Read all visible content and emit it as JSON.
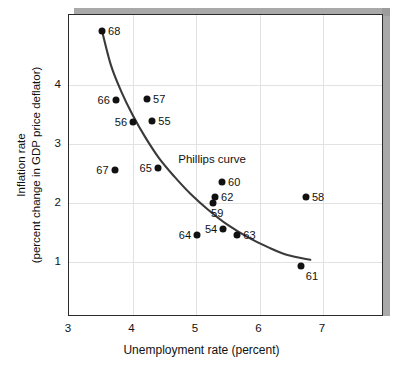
{
  "chart_data": {
    "type": "scatter",
    "title": "",
    "xlabel": "Unemployment rate (percent)",
    "ylabel_line1": "Inflation rate",
    "ylabel_line2": "(percent change in GDP  price  deflator)",
    "xlim": [
      3,
      7.96
    ],
    "ylim": [
      0.07,
      5.19
    ],
    "xticks": [
      3,
      4,
      5,
      6,
      7
    ],
    "xtick_labels": [
      "3",
      "4",
      "5",
      "6",
      "7"
    ],
    "yticks": [
      1,
      2,
      3,
      4
    ],
    "ytick_labels": [
      "1",
      "2",
      "3",
      "4"
    ],
    "grid": true,
    "legend": "none",
    "annotations": [
      {
        "text": "Phillips curve",
        "x": 4.72,
        "y": 2.73
      }
    ],
    "point_color": "#111111",
    "curve_color": "#3a3a3a",
    "grid_color": "#e2e2e2",
    "points": [
      {
        "label": "54",
        "x": 5.43,
        "y": 1.56,
        "label_pos": "left"
      },
      {
        "label": "55",
        "x": 4.31,
        "y": 3.39,
        "label_pos": "right"
      },
      {
        "label": "56",
        "x": 4.01,
        "y": 3.37,
        "label_pos": "left"
      },
      {
        "label": "57",
        "x": 4.23,
        "y": 3.77,
        "label_pos": "right"
      },
      {
        "label": "58",
        "x": 6.73,
        "y": 2.1,
        "label_pos": "right"
      },
      {
        "label": "59",
        "x": 5.27,
        "y": 2.0,
        "label_pos": "below"
      },
      {
        "label": "60",
        "x": 5.41,
        "y": 2.36,
        "label_pos": "right"
      },
      {
        "label": "61",
        "x": 6.65,
        "y": 0.93,
        "label_pos": "belowright"
      },
      {
        "label": "62",
        "x": 5.3,
        "y": 2.1,
        "label_pos": "right"
      },
      {
        "label": "63",
        "x": 5.65,
        "y": 1.46,
        "label_pos": "right"
      },
      {
        "label": "64",
        "x": 5.02,
        "y": 1.46,
        "label_pos": "left"
      },
      {
        "label": "65",
        "x": 4.4,
        "y": 2.59,
        "label_pos": "left"
      },
      {
        "label": "66",
        "x": 3.74,
        "y": 3.75,
        "label_pos": "left"
      },
      {
        "label": "67",
        "x": 3.72,
        "y": 2.56,
        "label_pos": "left"
      },
      {
        "label": "68",
        "x": 3.52,
        "y": 4.92,
        "label_pos": "right"
      }
    ],
    "curve": [
      {
        "x": 3.52,
        "y": 4.92
      },
      {
        "x": 3.66,
        "y": 4.34
      },
      {
        "x": 3.82,
        "y": 3.9
      },
      {
        "x": 4.0,
        "y": 3.5
      },
      {
        "x": 4.2,
        "y": 3.12
      },
      {
        "x": 4.42,
        "y": 2.76
      },
      {
        "x": 4.66,
        "y": 2.45
      },
      {
        "x": 4.92,
        "y": 2.15
      },
      {
        "x": 5.2,
        "y": 1.88
      },
      {
        "x": 5.5,
        "y": 1.63
      },
      {
        "x": 5.82,
        "y": 1.42
      },
      {
        "x": 6.14,
        "y": 1.25
      },
      {
        "x": 6.44,
        "y": 1.12
      },
      {
        "x": 6.8,
        "y": 1.04
      }
    ]
  }
}
